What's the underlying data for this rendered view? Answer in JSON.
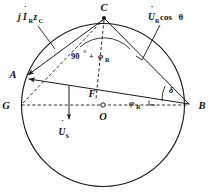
{
  "figure": {
    "kind": "phasor-circle-diagram",
    "background_color": "#ffffff",
    "line_color": "#1a1a1a"
  },
  "points": [
    {
      "id": "A",
      "label": "A",
      "x": 24,
      "y": 77,
      "marker": "none"
    },
    {
      "id": "B",
      "label": "B",
      "x": 191,
      "y": 105,
      "marker": "none"
    },
    {
      "id": "C",
      "label": "C",
      "x": 104,
      "y": 16,
      "marker": "dot"
    },
    {
      "id": "G",
      "label": "G",
      "x": 11,
      "y": 105,
      "marker": "none"
    },
    {
      "id": "F",
      "label": "F",
      "x": 92,
      "y": 92,
      "marker": "none"
    },
    {
      "id": "O",
      "label": "O",
      "x": 103,
      "y": 105,
      "marker": "ring"
    }
  ],
  "labels": {
    "vertex_a": "A",
    "vertex_b": "B",
    "vertex_c": "C",
    "vertex_g": "G",
    "vertex_f": "F",
    "vertex_o": "O"
  },
  "vectors": [
    {
      "id": "jIRzC",
      "name": "current-impedance-drop-vector",
      "text_main": "j",
      "text_italic": "I",
      "text_sub1": "R",
      "text_mid": "z",
      "text_sub2": "C",
      "full_text": "jİRzC",
      "from": "C",
      "to": "A",
      "leader_label_x": 22,
      "leader_label_y": 18
    },
    {
      "id": "URcos",
      "name": "receiving-voltage-cos-theta-vector",
      "text_italic": "U",
      "text_sub1": "R",
      "text_rest": "cos",
      "text_greek": "θ",
      "full_text": "U̇R cos θ",
      "from": "C",
      "to": "B",
      "leader_label_x": 146,
      "leader_label_y": 18
    },
    {
      "id": "US",
      "name": "sending-voltage-vector",
      "text_italic": "U",
      "text_sub1": "S",
      "full_text": "U̇S",
      "from": "F",
      "to": "below-GB-line",
      "leader_label_x": 56,
      "leader_label_y": 131
    },
    {
      "id": "AB",
      "name": "chord-ab-vector",
      "from": "B",
      "to": "A"
    }
  ],
  "angles": [
    {
      "id": "angle-at-C",
      "name": "angle-90-plus-phi-r",
      "prefix": "90",
      "degree_symbol": "°",
      "plus": "+",
      "greek": "φ",
      "sub": "R",
      "full_text": "90° + φR",
      "at_vertex": "C",
      "label_x": 74,
      "label_y": 56
    },
    {
      "id": "angle-at-B-phi",
      "name": "angle-phi-r",
      "greek": "φ",
      "sub": "R",
      "full_text": "φR",
      "at_vertex": "B",
      "label_x": 130,
      "label_y": 106
    },
    {
      "id": "angle-at-B-delta",
      "name": "angle-delta",
      "greek": "δ",
      "full_text": "δ",
      "at_vertex": "B",
      "label_x": 168,
      "label_y": 92
    }
  ],
  "geometry": {
    "circle": {
      "cx": 103,
      "cy": 105,
      "r": 81.5
    },
    "diameter_line": {
      "x1": 11,
      "y1": 105,
      "x2": 191,
      "y2": 105,
      "style": "dashed"
    },
    "dashed_segments": [
      {
        "from": "G",
        "to": "C"
      },
      {
        "from": "C",
        "to": "F-area"
      }
    ],
    "solid_segments": [
      {
        "from": "C",
        "to": "A"
      },
      {
        "from": "C",
        "to": "B"
      },
      {
        "from": "B",
        "to": "A"
      },
      {
        "from": "A",
        "to": "G-arc"
      }
    ]
  }
}
